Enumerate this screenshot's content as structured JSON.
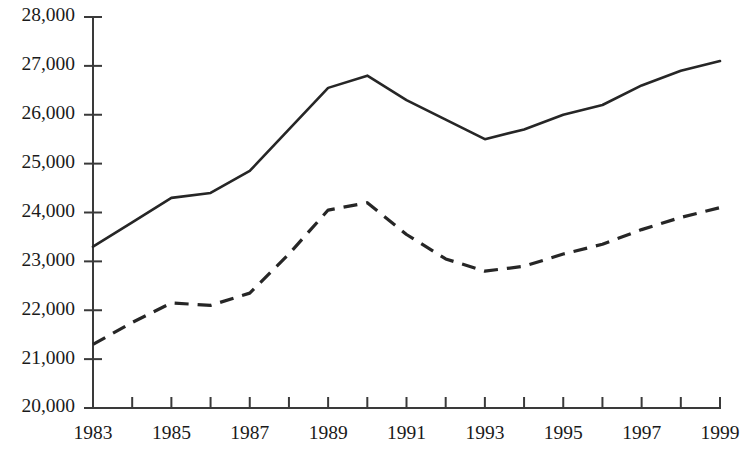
{
  "chart_data": {
    "type": "line",
    "title": "",
    "subtitle": "",
    "xlabel": "",
    "ylabel": "",
    "grid": false,
    "legend_position": "none",
    "annotations": [],
    "x": [
      1983,
      1984,
      1985,
      1986,
      1987,
      1988,
      1989,
      1990,
      1991,
      1992,
      1993,
      1994,
      1995,
      1996,
      1997,
      1998,
      1999
    ],
    "xlim": [
      1983,
      1999
    ],
    "ylim": [
      20000,
      28000
    ],
    "x_tick_values": [
      1983,
      1984,
      1985,
      1986,
      1987,
      1988,
      1989,
      1990,
      1991,
      1992,
      1993,
      1994,
      1995,
      1996,
      1997,
      1998,
      1999
    ],
    "x_tick_labels": [
      "1983",
      "",
      "1985",
      "",
      "1987",
      "",
      "1989",
      "",
      "1991",
      "",
      "1993",
      "",
      "1995",
      "",
      "1997",
      "",
      "1999"
    ],
    "y_tick_values": [
      20000,
      21000,
      22000,
      23000,
      24000,
      25000,
      26000,
      27000,
      28000
    ],
    "y_tick_labels": [
      "20,000",
      "21,000",
      "22,000",
      "23,000",
      "24,000",
      "25,000",
      "26,000",
      "27,000",
      "28,000"
    ],
    "series": [
      {
        "name": "solid-series",
        "style": "solid",
        "color": "#262626",
        "values": [
          23300,
          23800,
          24300,
          24400,
          24850,
          25700,
          26550,
          26800,
          26300,
          25900,
          25500,
          25700,
          26000,
          26200,
          26600,
          26900,
          27100
        ]
      },
      {
        "name": "dashed-series",
        "style": "dashed",
        "color": "#262626",
        "values": [
          21300,
          21750,
          22150,
          22100,
          22350,
          23150,
          24050,
          24200,
          23550,
          23050,
          22800,
          22900,
          23150,
          23350,
          23650,
          23900,
          24100
        ]
      }
    ]
  },
  "axes": {
    "y_axis_name": "y-axis",
    "x_axis_name": "x-axis"
  }
}
